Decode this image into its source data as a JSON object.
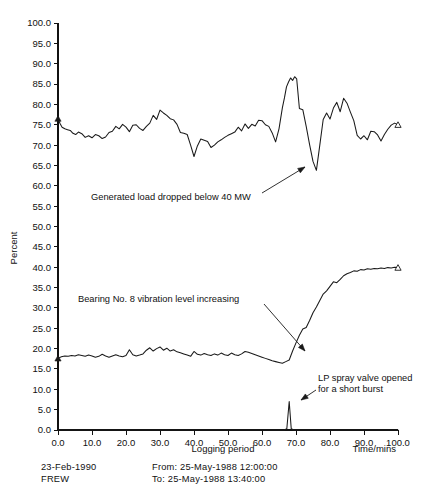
{
  "chart_data": {
    "type": "line",
    "title": "",
    "subtitle": "",
    "xlabel": "Time/mins",
    "ylabel": "Percent",
    "xlim": [
      0.0,
      100.0
    ],
    "ylim": [
      0.0,
      100.0
    ],
    "grid": false,
    "legend_position": "none",
    "x_ticks": [
      "0.0",
      "10.0",
      "20.0",
      "30.0",
      "40.0",
      "50.0",
      "60.0",
      "70.0",
      "80.0",
      "90.0",
      "100.0"
    ],
    "x_tick_values": [
      0,
      10,
      20,
      30,
      40,
      50,
      60,
      70,
      80,
      90,
      100
    ],
    "y_ticks": [
      "0.0",
      "5.0",
      "10.0",
      "15.0",
      "20.0",
      "25.0",
      "30.0",
      "35.0",
      "40.0",
      "45.0",
      "50.0",
      "55.0",
      "60.0",
      "65.0",
      "70.0",
      "75.0",
      "80.0",
      "85.0",
      "90.0",
      "95.0",
      "100.0"
    ],
    "y_tick_values": [
      0,
      5,
      10,
      15,
      20,
      25,
      30,
      35,
      40,
      45,
      50,
      55,
      60,
      65,
      70,
      75,
      80,
      85,
      90,
      95,
      100
    ],
    "series": [
      {
        "name": "Generated load percent",
        "color": "#1a1a1a",
        "start_marker": "triangle",
        "end_marker": "triangle",
        "x": [
          0.0,
          0.6,
          1.2,
          2.0,
          2.8,
          3.6,
          4.4,
          5.2,
          6.0,
          7.0,
          8.0,
          9.0,
          10.0,
          11.0,
          12.0,
          13.0,
          14.0,
          15.0,
          16.0,
          17.0,
          18.0,
          19.0,
          20.0,
          21.0,
          22.0,
          23.0,
          24.0,
          25.0,
          26.0,
          27.0,
          28.0,
          29.0,
          30.0,
          31.0,
          32.0,
          33.0,
          34.0,
          35.0,
          36.0,
          37.0,
          38.0,
          39.0,
          40.0,
          41.0,
          42.0,
          43.0,
          44.0,
          45.0,
          46.0,
          47.0,
          48.0,
          49.0,
          50.0,
          51.0,
          52.0,
          53.0,
          54.0,
          55.0,
          56.0,
          57.0,
          58.0,
          59.0,
          60.0,
          61.0,
          62.0,
          63.0,
          64.0,
          65.0,
          66.0,
          66.6,
          67.2,
          67.8,
          68.4,
          69.0,
          69.6,
          70.2,
          71.0,
          72.0,
          73.0,
          74.0,
          75.0,
          76.0,
          77.0,
          78.0,
          79.0,
          80.0,
          81.0,
          82.0,
          83.0,
          84.0,
          85.0,
          86.0,
          87.0,
          88.0,
          89.0,
          90.0,
          91.0,
          92.0,
          93.0,
          94.0,
          95.0,
          96.0,
          97.0,
          98.0,
          99.0,
          100.0
        ],
        "y": [
          76.5,
          75.3,
          74.4,
          74.0,
          73.8,
          73.6,
          72.9,
          72.6,
          73.2,
          72.8,
          71.9,
          72.3,
          71.8,
          72.6,
          72.3,
          71.6,
          72.0,
          73.1,
          73.4,
          74.6,
          74.0,
          75.1,
          74.4,
          73.3,
          74.9,
          75.0,
          74.1,
          73.6,
          74.6,
          75.4,
          77.3,
          76.3,
          78.6,
          77.9,
          77.3,
          76.5,
          76.2,
          75.1,
          73.1,
          72.9,
          72.6,
          70.0,
          67.2,
          69.8,
          71.5,
          71.2,
          70.9,
          69.4,
          70.0,
          70.8,
          71.3,
          71.9,
          72.4,
          72.8,
          73.2,
          74.4,
          73.5,
          75.2,
          74.1,
          75.1,
          74.7,
          76.1,
          76.0,
          75.0,
          74.6,
          73.0,
          70.8,
          74.0,
          79.2,
          81.6,
          84.3,
          85.5,
          86.5,
          85.9,
          86.8,
          86.3,
          79.0,
          78.7,
          74.6,
          70.1,
          66.0,
          63.8,
          70.0,
          76.3,
          77.9,
          76.4,
          79.1,
          80.5,
          78.2,
          81.5,
          80.3,
          78.1,
          76.0,
          72.4,
          71.5,
          72.3,
          71.3,
          73.4,
          73.3,
          72.5,
          71.0,
          72.6,
          73.9,
          74.9,
          75.4,
          75.0
        ]
      },
      {
        "name": "Bearing No. 8 vibration level percent",
        "color": "#1a1a1a",
        "start_marker": "triangle",
        "end_marker": "triangle",
        "x": [
          0.0,
          1.0,
          2.0,
          3.0,
          4.0,
          5.0,
          6.0,
          7.0,
          8.0,
          9.0,
          10.0,
          11.0,
          12.0,
          13.0,
          14.0,
          15.0,
          16.0,
          17.0,
          18.0,
          19.0,
          20.0,
          21.0,
          22.0,
          23.0,
          24.0,
          25.0,
          26.0,
          27.0,
          28.0,
          29.0,
          30.0,
          31.0,
          32.0,
          33.0,
          34.0,
          35.0,
          36.0,
          37.0,
          38.0,
          39.0,
          40.0,
          41.0,
          42.0,
          43.0,
          44.0,
          45.0,
          46.0,
          47.0,
          48.0,
          49.0,
          50.0,
          51.0,
          52.0,
          53.0,
          54.0,
          55.0,
          56.0,
          57.0,
          58.0,
          59.0,
          60.0,
          61.0,
          62.0,
          63.0,
          64.0,
          65.0,
          66.0,
          67.0,
          68.0,
          69.0,
          70.0,
          71.0,
          72.0,
          73.0,
          74.0,
          75.0,
          76.0,
          77.0,
          78.0,
          79.0,
          80.0,
          81.0,
          82.0,
          83.0,
          84.0,
          85.0,
          86.0,
          87.0,
          88.0,
          89.0,
          90.0,
          91.0,
          92.0,
          93.0,
          94.0,
          95.0,
          96.0,
          97.0,
          98.0,
          99.0,
          100.0
        ],
        "y": [
          17.6,
          18.0,
          18.2,
          18.1,
          18.3,
          18.2,
          18.5,
          18.3,
          18.1,
          18.4,
          18.2,
          17.9,
          18.1,
          18.6,
          18.2,
          17.9,
          18.2,
          18.5,
          18.2,
          18.0,
          18.3,
          19.7,
          18.5,
          18.2,
          18.4,
          18.7,
          19.6,
          20.2,
          19.4,
          20.0,
          20.4,
          19.6,
          20.1,
          19.4,
          19.7,
          19.2,
          19.0,
          18.7,
          18.4,
          18.1,
          19.3,
          18.6,
          18.4,
          18.8,
          18.5,
          18.3,
          18.7,
          18.4,
          18.9,
          18.5,
          18.3,
          18.9,
          18.5,
          18.3,
          18.7,
          19.3,
          19.1,
          18.8,
          18.5,
          18.2,
          17.9,
          17.6,
          17.3,
          17.0,
          16.8,
          16.6,
          16.4,
          16.8,
          17.2,
          19.4,
          21.4,
          23.3,
          24.8,
          25.2,
          26.9,
          28.8,
          30.2,
          31.8,
          33.4,
          34.2,
          35.3,
          36.4,
          36.2,
          37.0,
          37.9,
          38.4,
          38.7,
          39.1,
          39.0,
          39.4,
          39.3,
          39.6,
          39.5,
          39.7,
          39.6,
          39.8,
          39.7,
          39.9,
          39.8,
          40.0,
          39.9
        ]
      },
      {
        "name": "LP spray valve burst",
        "color": "#1a1a1a",
        "start_marker": "none",
        "end_marker": "none",
        "x": [
          0.0,
          66.5,
          67.3,
          68.0,
          68.6,
          69.4,
          100.0
        ],
        "y": [
          0.0,
          0.0,
          0.3,
          7.0,
          0.3,
          0.0,
          0.0
        ]
      }
    ],
    "annotations": [
      {
        "id": "generated-load-annotation",
        "text": "Generated load dropped below 40 MW",
        "text_x": 91,
        "text_y": 200,
        "leader_from_x": 262,
        "leader_from_y": 193,
        "leader_to_x": 305,
        "leader_to_y": 167
      },
      {
        "id": "bearing-vibration-annotation",
        "text": "Bearing No. 8 vibration level increasing",
        "text_x": 78,
        "text_y": 302,
        "leader_from_x": 264,
        "leader_from_y": 304,
        "leader_to_x": 305,
        "leader_to_y": 351
      },
      {
        "id": "lp-spray-annotation-line-1",
        "text": "LP spray valve opened",
        "text_x": 318,
        "text_y": 381,
        "leader_from_x": 316,
        "leader_from_y": 390,
        "leader_to_x": 301,
        "leader_to_y": 400
      },
      {
        "id": "lp-spray-annotation-line-2",
        "text": "for a short burst",
        "text_x": 318,
        "text_y": 392,
        "leader_from_x": 0,
        "leader_from_y": 0,
        "leader_to_x": 0,
        "leader_to_y": 0
      }
    ]
  },
  "axis": {
    "y_title": "Percent",
    "x_title": "Time/mins",
    "x_subtitle": "Logging period"
  },
  "footer": {
    "date": "23-Feb-1990",
    "user": "FREW",
    "from_line": "From: 25-May-1988  12:00:00",
    "to_line": "To: 25-May-1988  13:40:00"
  }
}
